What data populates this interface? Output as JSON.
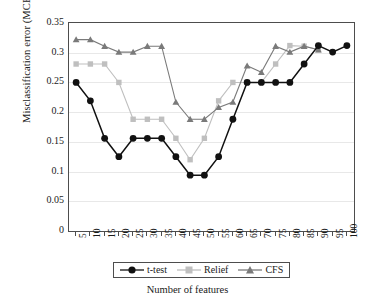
{
  "chart_data": {
    "type": "line",
    "title": "",
    "xlabel": "Number of features",
    "ylabel": "Misclassification error (MCE)",
    "categories": [
      5,
      10,
      15,
      20,
      25,
      30,
      35,
      40,
      45,
      50,
      55,
      60,
      65,
      70,
      75,
      80,
      85,
      90,
      95,
      100
    ],
    "xtick_labels": [
      "5",
      "10",
      "15",
      "20",
      "25",
      "30",
      "35",
      "40",
      "45",
      "50",
      "55",
      "60",
      "65",
      "70",
      "75",
      "80",
      "85",
      "90",
      "95",
      "100"
    ],
    "ytick_labels": [
      "0",
      "0.05",
      "0.1",
      "0.15",
      "0.2",
      "0.25",
      "0.3",
      "0.35"
    ],
    "ytick_values": [
      0,
      0.05,
      0.1,
      0.15,
      0.2,
      0.25,
      0.3,
      0.35
    ],
    "ylim": [
      0,
      0.35
    ],
    "grid": true,
    "legend_position": "bottom",
    "series": [
      {
        "name": "t-test",
        "marker": "circle",
        "color": "#111111",
        "values": [
          0.25,
          0.219,
          0.156,
          0.125,
          0.156,
          0.156,
          0.156,
          0.125,
          0.094,
          0.094,
          0.125,
          0.188,
          0.25,
          0.25,
          0.25,
          0.25,
          0.281,
          0.312,
          0.301,
          0.312
        ]
      },
      {
        "name": "Relief",
        "marker": "square",
        "color": "#bfbfbf",
        "values": [
          0.281,
          0.281,
          0.281,
          0.25,
          0.188,
          0.188,
          0.188,
          0.156,
          0.12,
          0.156,
          0.219,
          0.25,
          0.25,
          0.25,
          0.281,
          0.312,
          0.311,
          0.305,
          null,
          null
        ]
      },
      {
        "name": "CFS",
        "marker": "triangle",
        "color": "#7a7a7a",
        "values": [
          0.322,
          0.322,
          0.311,
          0.301,
          0.301,
          0.311,
          0.311,
          0.217,
          0.188,
          0.188,
          0.208,
          0.217,
          0.278,
          0.267,
          0.311,
          0.301,
          0.311,
          0.305,
          null,
          null
        ]
      }
    ]
  },
  "legend": {
    "entries": [
      {
        "label": "t-test"
      },
      {
        "label": "Relief"
      },
      {
        "label": "CFS"
      }
    ]
  }
}
